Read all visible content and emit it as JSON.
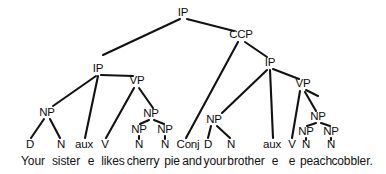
{
  "figure": {
    "kind": "constituency-syntax-tree",
    "sentence": "Your sister e likes cherry pie and your brother e e peach cobbler.",
    "width": 386,
    "height": 174,
    "ink_color": "#121212",
    "background_color": "#ffffff"
  },
  "nodes": {
    "root_ip": "IP",
    "ccp": "CCP",
    "left_ip": "IP",
    "right_ip": "IP",
    "left_vp": "VP",
    "right_vp": "VP",
    "left_subject_np": "NP",
    "right_subject_np": "NP",
    "left_object_np": "NP",
    "right_object_np": "NP",
    "left_object_np_a": "NP",
    "left_object_np_b": "NP",
    "right_object_np_a": "NP",
    "right_object_np_b": "NP"
  },
  "phrase_labels": [
    {
      "id": "root-ip",
      "text": "IP",
      "x": 183,
      "y": 13
    },
    {
      "id": "ccp",
      "text": "CCP",
      "x": 241,
      "y": 35
    },
    {
      "id": "left-ip",
      "text": "IP",
      "x": 98,
      "y": 69
    },
    {
      "id": "right-ip",
      "text": "IP",
      "x": 270,
      "y": 63
    },
    {
      "id": "left-vp",
      "text": "VP",
      "x": 137,
      "y": 81
    },
    {
      "id": "right-vp",
      "text": "VP",
      "x": 303,
      "y": 84
    },
    {
      "id": "left-subject-np",
      "text": "NP",
      "x": 47,
      "y": 113
    },
    {
      "id": "right-subject-np",
      "text": "NP",
      "x": 214,
      "y": 120
    },
    {
      "id": "left-object-np",
      "text": "NP",
      "x": 151,
      "y": 114
    },
    {
      "id": "right-object-np",
      "text": "NP",
      "x": 318,
      "y": 117
    },
    {
      "id": "left-object-np-a",
      "text": "NP",
      "x": 139,
      "y": 130
    },
    {
      "id": "left-object-np-b",
      "text": "NP",
      "x": 165,
      "y": 130
    },
    {
      "id": "right-object-np-a",
      "text": "NP",
      "x": 306,
      "y": 132
    },
    {
      "id": "right-object-np-b",
      "text": "NP",
      "x": 331,
      "y": 132
    }
  ],
  "pos_labels": [
    {
      "id": "pos-d-left",
      "text": "D",
      "x": 30,
      "y": 145
    },
    {
      "id": "pos-n-left",
      "text": "N",
      "x": 61,
      "y": 145
    },
    {
      "id": "pos-aux-left",
      "text": "aux",
      "x": 84,
      "y": 145
    },
    {
      "id": "pos-v-left",
      "text": "V",
      "x": 105,
      "y": 145
    },
    {
      "id": "pos-n-obj-a",
      "text": "N",
      "x": 139,
      "y": 145
    },
    {
      "id": "pos-n-obj-b",
      "text": "N",
      "x": 165,
      "y": 145
    },
    {
      "id": "pos-conj",
      "text": "Conj",
      "x": 188,
      "y": 145
    },
    {
      "id": "pos-d-right",
      "text": "D",
      "x": 208,
      "y": 145
    },
    {
      "id": "pos-n-right",
      "text": "N",
      "x": 231,
      "y": 145
    },
    {
      "id": "pos-aux-right",
      "text": "aux",
      "x": 272,
      "y": 145
    },
    {
      "id": "pos-v-right",
      "text": "V",
      "x": 292,
      "y": 145
    },
    {
      "id": "pos-n-obj-c",
      "text": "N",
      "x": 306,
      "y": 145
    },
    {
      "id": "pos-n-obj-d",
      "text": "N",
      "x": 331,
      "y": 145
    }
  ],
  "words": [
    {
      "id": "word-your-1",
      "text": "Your",
      "x": 33,
      "y": 161
    },
    {
      "id": "word-sister",
      "text": "sister",
      "x": 66,
      "y": 161
    },
    {
      "id": "word-e-1",
      "text": "e",
      "x": 91,
      "y": 161
    },
    {
      "id": "word-likes",
      "text": "likes",
      "x": 113,
      "y": 161
    },
    {
      "id": "word-cherry",
      "text": "cherry",
      "x": 143,
      "y": 161
    },
    {
      "id": "word-pie",
      "text": "pie",
      "x": 172,
      "y": 161
    },
    {
      "id": "word-and",
      "text": "and",
      "x": 192,
      "y": 161
    },
    {
      "id": "word-your-2",
      "text": "your",
      "x": 215,
      "y": 161
    },
    {
      "id": "word-brother",
      "text": "brother",
      "x": 246,
      "y": 161
    },
    {
      "id": "word-e-2",
      "text": "e",
      "x": 275,
      "y": 161
    },
    {
      "id": "word-e-3",
      "text": "e",
      "x": 292,
      "y": 161
    },
    {
      "id": "word-peach",
      "text": "peach",
      "x": 316,
      "y": 161
    },
    {
      "id": "word-cobbler",
      "text": "cobbler.",
      "x": 352,
      "y": 161
    }
  ],
  "edges": [
    {
      "id": "root-to-left-ip",
      "x1": 180,
      "y1": 19,
      "x2": 103,
      "y2": 55
    },
    {
      "id": "root-to-ccp",
      "x1": 187,
      "y1": 19,
      "x2": 234,
      "y2": 31
    },
    {
      "id": "ccp-to-conj",
      "x1": 238,
      "y1": 42,
      "x2": 186,
      "y2": 138
    },
    {
      "id": "ccp-to-right-ip",
      "x1": 245,
      "y1": 42,
      "x2": 267,
      "y2": 57
    },
    {
      "id": "left-ip-to-np",
      "x1": 96,
      "y1": 76,
      "x2": 53,
      "y2": 106
    },
    {
      "id": "left-ip-to-aux",
      "x1": 98,
      "y1": 76,
      "x2": 85,
      "y2": 138
    },
    {
      "id": "left-ip-to-vp",
      "x1": 101,
      "y1": 75,
      "x2": 133,
      "y2": 76
    },
    {
      "id": "left-vp-to-v",
      "x1": 134,
      "y1": 88,
      "x2": 106,
      "y2": 138
    },
    {
      "id": "left-vp-to-np",
      "x1": 139,
      "y1": 88,
      "x2": 153,
      "y2": 108
    },
    {
      "id": "left-np-to-np-a",
      "x1": 149,
      "y1": 120,
      "x2": 140,
      "y2": 124
    },
    {
      "id": "left-np-to-np-b",
      "x1": 154,
      "y1": 120,
      "x2": 164,
      "y2": 124
    },
    {
      "id": "left-npa-to-n",
      "x1": 139,
      "y1": 136,
      "x2": 139,
      "y2": 139
    },
    {
      "id": "left-npb-to-n",
      "x1": 165,
      "y1": 136,
      "x2": 165,
      "y2": 139
    },
    {
      "id": "left-subj-np-to-d",
      "x1": 44,
      "y1": 119,
      "x2": 31,
      "y2": 138
    },
    {
      "id": "left-subj-np-to-n",
      "x1": 50,
      "y1": 119,
      "x2": 60,
      "y2": 138
    },
    {
      "id": "right-ip-to-np",
      "x1": 267,
      "y1": 70,
      "x2": 222,
      "y2": 113
    },
    {
      "id": "right-ip-to-aux",
      "x1": 270,
      "y1": 70,
      "x2": 273,
      "y2": 138
    },
    {
      "id": "right-ip-to-vp",
      "x1": 273,
      "y1": 69,
      "x2": 299,
      "y2": 79
    },
    {
      "id": "right-vp-to-v",
      "x1": 300,
      "y1": 91,
      "x2": 292,
      "y2": 138
    },
    {
      "id": "right-vp-stub",
      "x1": 306,
      "y1": 90,
      "x2": 318,
      "y2": 96
    },
    {
      "id": "right-vp-to-np",
      "x1": 305,
      "y1": 92,
      "x2": 316,
      "y2": 111
    },
    {
      "id": "right-np-to-np-a",
      "x1": 316,
      "y1": 123,
      "x2": 307,
      "y2": 126
    },
    {
      "id": "right-np-to-np-b",
      "x1": 321,
      "y1": 123,
      "x2": 330,
      "y2": 126
    },
    {
      "id": "right-npa-to-n",
      "x1": 306,
      "y1": 138,
      "x2": 306,
      "y2": 140
    },
    {
      "id": "right-npb-to-n",
      "x1": 331,
      "y1": 138,
      "x2": 331,
      "y2": 140
    },
    {
      "id": "right-subj-np-to-d",
      "x1": 211,
      "y1": 126,
      "x2": 208,
      "y2": 138
    },
    {
      "id": "right-subj-np-to-n",
      "x1": 217,
      "y1": 126,
      "x2": 230,
      "y2": 138
    }
  ]
}
